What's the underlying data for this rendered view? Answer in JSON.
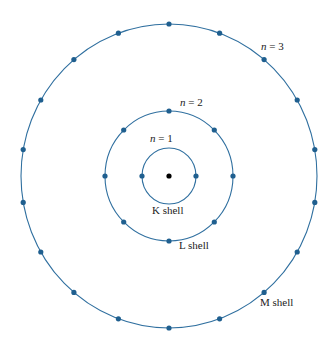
{
  "diagram": {
    "nucleus": {
      "cx": 169,
      "cy": 176
    },
    "shells": [
      {
        "n_label": "n = 1",
        "name": "K shell",
        "rx": 27,
        "ry": 28,
        "electrons": 2,
        "start_deg": 180
      },
      {
        "n_label": "n = 2",
        "name": "L shell",
        "rx": 64,
        "ry": 65,
        "electrons": 8,
        "start_deg": 0
      },
      {
        "n_label": "n = 3",
        "name": "M shell",
        "rx": 148,
        "ry": 152,
        "electrons": 18,
        "start_deg": 0
      }
    ],
    "colors": {
      "orbit": "#2f6f9f",
      "electron": "#1f5f8f",
      "nucleus": "#000000"
    }
  }
}
